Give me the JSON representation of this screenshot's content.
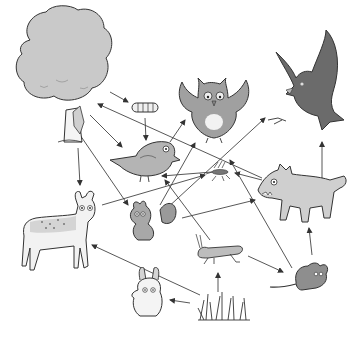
{
  "diagram": {
    "type": "food-web",
    "background": "#ffffff",
    "colors": {
      "light_fill": "#d4d4d4",
      "mid_fill": "#9a9a9a",
      "dark_fill": "#5e5e5e",
      "line": "#333333",
      "arrow": "#444444"
    },
    "organisms": [
      {
        "id": "tree",
        "name": "tree",
        "x": 55,
        "y": 60
      },
      {
        "id": "caterpillar",
        "name": "caterpillar",
        "x": 145,
        "y": 108
      },
      {
        "id": "small-bird",
        "name": "small bird",
        "x": 155,
        "y": 158
      },
      {
        "id": "owl",
        "name": "owl",
        "x": 215,
        "y": 105
      },
      {
        "id": "hawk",
        "name": "hawk",
        "x": 315,
        "y": 85
      },
      {
        "id": "mosquito",
        "name": "mosquito",
        "x": 220,
        "y": 172
      },
      {
        "id": "wolf",
        "name": "wolf",
        "x": 298,
        "y": 195
      },
      {
        "id": "deer",
        "name": "deer",
        "x": 52,
        "y": 240
      },
      {
        "id": "squirrel",
        "name": "squirrel",
        "x": 148,
        "y": 215
      },
      {
        "id": "grasshopper",
        "name": "grasshopper",
        "x": 218,
        "y": 252
      },
      {
        "id": "mouse",
        "name": "mouse",
        "x": 310,
        "y": 275
      },
      {
        "id": "rabbit",
        "name": "rabbit",
        "x": 148,
        "y": 295
      },
      {
        "id": "grass",
        "name": "grass",
        "x": 225,
        "y": 308
      }
    ],
    "arrows": [
      {
        "from": "tree",
        "to": "caterpillar",
        "x1": 110,
        "y1": 92,
        "x2": 128,
        "y2": 102
      },
      {
        "from": "caterpillar",
        "to": "small-bird",
        "x1": 145,
        "y1": 118,
        "x2": 146,
        "y2": 140
      },
      {
        "from": "tree",
        "to": "small-bird",
        "x1": 90,
        "y1": 115,
        "x2": 122,
        "y2": 147
      },
      {
        "from": "wolf",
        "to": "tree",
        "x1": 262,
        "y1": 178,
        "x2": 98,
        "y2": 104
      },
      {
        "from": "tree",
        "to": "deer",
        "x1": 78,
        "y1": 148,
        "x2": 80,
        "y2": 185
      },
      {
        "from": "tree",
        "to": "squirrel",
        "x1": 80,
        "y1": 135,
        "x2": 128,
        "y2": 205
      },
      {
        "from": "small-bird",
        "to": "owl",
        "x1": 170,
        "y1": 142,
        "x2": 185,
        "y2": 120
      },
      {
        "from": "squirrel",
        "to": "owl",
        "x1": 160,
        "y1": 205,
        "x2": 195,
        "y2": 143
      },
      {
        "from": "squirrel",
        "to": "hawk",
        "x1": 165,
        "y1": 210,
        "x2": 265,
        "y2": 118
      },
      {
        "from": "deer",
        "to": "mosquito",
        "x1": 102,
        "y1": 205,
        "x2": 205,
        "y2": 175
      },
      {
        "from": "wolf",
        "to": "mosquito",
        "x1": 262,
        "y1": 180,
        "x2": 235,
        "y2": 173
      },
      {
        "from": "mosquito",
        "to": "small-bird",
        "x1": 212,
        "y1": 172,
        "x2": 162,
        "y2": 176
      },
      {
        "from": "mouse",
        "to": "mosquito",
        "x1": 292,
        "y1": 268,
        "x2": 230,
        "y2": 160
      },
      {
        "from": "squirrel",
        "to": "wolf",
        "x1": 182,
        "y1": 218,
        "x2": 255,
        "y2": 200
      },
      {
        "from": "grass",
        "to": "deer",
        "x1": 200,
        "y1": 295,
        "x2": 92,
        "y2": 245
      },
      {
        "from": "grass",
        "to": "rabbit",
        "x1": 190,
        "y1": 303,
        "x2": 170,
        "y2": 300
      },
      {
        "from": "grass",
        "to": "grasshopper",
        "x1": 218,
        "y1": 292,
        "x2": 218,
        "y2": 273
      },
      {
        "from": "grasshopper",
        "to": "mouse",
        "x1": 248,
        "y1": 256,
        "x2": 283,
        "y2": 272
      },
      {
        "from": "mouse",
        "to": "wolf",
        "x1": 312,
        "y1": 255,
        "x2": 309,
        "y2": 228
      },
      {
        "from": "wolf",
        "to": "hawk",
        "x1": 322,
        "y1": 180,
        "x2": 322,
        "y2": 142
      },
      {
        "from": "mouse",
        "to": "hawk",
        "x1": 318,
        "y1": 258,
        "x2": 318,
        "y2": 258
      },
      {
        "from": "grasshopper",
        "to": "small-bird",
        "x1": 210,
        "y1": 240,
        "x2": 165,
        "y2": 180
      }
    ]
  }
}
